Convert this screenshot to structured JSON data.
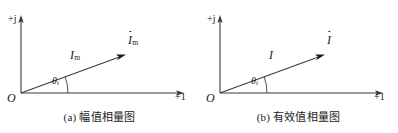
{
  "figure": {
    "panels": [
      {
        "id": "a",
        "caption": "(a) 幅值相量图",
        "axis_imag_label": "+j",
        "axis_real_label": "+1",
        "origin_label": "O",
        "magnitude_label": "I",
        "magnitude_subscript": "m",
        "phasor_label": "I",
        "phasor_subscript": "m",
        "phasor_has_dot": true,
        "angle_label": "θ",
        "angle_subscript": "i"
      },
      {
        "id": "b",
        "caption": "(b) 有效值相量图",
        "axis_imag_label": "+j",
        "axis_real_label": "+1",
        "origin_label": "O",
        "magnitude_label": "I",
        "magnitude_subscript": "",
        "phasor_label": "I",
        "phasor_subscript": "",
        "phasor_has_dot": true,
        "angle_label": "θ",
        "angle_subscript": "i"
      }
    ],
    "colors": {
      "line": "#3a3a3a",
      "text": "#1a1a1a",
      "background": "#ffffff"
    },
    "geometry": {
      "origin_x": 21,
      "origin_y": 93,
      "imag_axis_top_y": 16,
      "real_axis_right_x": 184,
      "vector_tip_x": 126,
      "vector_tip_y": 54,
      "angle_degrees": 20
    }
  }
}
